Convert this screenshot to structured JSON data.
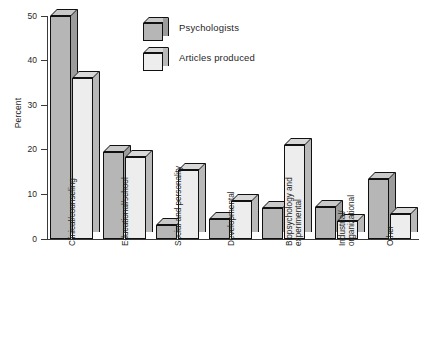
{
  "chart_data": {
    "type": "bar",
    "title": "",
    "subtitle": "",
    "xlabel": "",
    "ylabel": "Percent",
    "ylim": [
      0,
      50
    ],
    "ytick_values": [
      0,
      10,
      20,
      30,
      40,
      50
    ],
    "ytick_labels": [
      "0",
      "10",
      "20",
      "30",
      "40",
      "50"
    ],
    "grid": false,
    "legend_position": "top-center",
    "categories": [
      "Clinical/counseling",
      "Educational/school",
      "Social and personality",
      "Developmental",
      "Biopsychology and\nexperimental",
      "Industrial/\norganizational",
      "Other"
    ],
    "series": [
      {
        "name": "Psychologists",
        "color": "#b6b6b6",
        "values": [
          50,
          19.5,
          3.2,
          4.5,
          7,
          7.2,
          13.5
        ]
      },
      {
        "name": "Articles produced",
        "color": "#ededed",
        "values": [
          36,
          18.3,
          15.5,
          8.5,
          21,
          4,
          5.5
        ]
      }
    ]
  },
  "legend": {
    "items": [
      {
        "label": "Psychologists",
        "swatch": "dark"
      },
      {
        "label": "Articles produced",
        "swatch": "light"
      }
    ]
  }
}
